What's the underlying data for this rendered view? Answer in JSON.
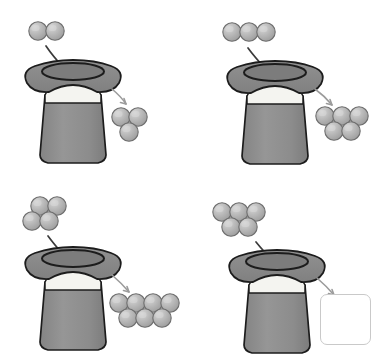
{
  "page": {
    "background_color": "#ffffff",
    "width": 388,
    "height": 356,
    "layout": "2x2 grid of hat panels"
  },
  "palette": {
    "ball_fill": "#b4b4b4",
    "ball_highlight": "#d2d2d2",
    "ball_shadow": "#9a9a9a",
    "ball_outline": "#6e6e6e",
    "hat_brim": "#8b8b8b",
    "hat_brim_outline": "#1c1c1c",
    "hat_body": "#8e8e8e",
    "hat_body_outline": "#1c1c1c",
    "hat_band": "#f4f4f0",
    "hat_opening": "#7a7a7a",
    "arrow_in": "#3a3a3a",
    "arrow_out": "#9b9b9b",
    "answer_box_border": "#c9c9c9",
    "answer_box_fill": "#ffffff"
  },
  "puzzle": {
    "kind": "function-machine",
    "machine_icon": "magic-hat",
    "rule_description": "output = 2 x input - 1",
    "unknown_marker": "empty answer box"
  },
  "panels": [
    {
      "id": "panel-1",
      "position": "top-left",
      "input": {
        "label": "2",
        "count": 2,
        "rows": [
          2
        ],
        "icon": "ball"
      },
      "machine": {
        "label": "magic hat",
        "icon": "magic-hat"
      },
      "arrow_in": {
        "icon": "curved-arrow-into-hat",
        "color": "#3a3a3a"
      },
      "arrow_out": {
        "icon": "curved-arrow-out-of-hat",
        "color": "#9b9b9b"
      },
      "output": {
        "label": "3",
        "count": 3,
        "rows": [
          2,
          1
        ],
        "icon": "ball",
        "is_unknown": false
      }
    },
    {
      "id": "panel-2",
      "position": "top-right",
      "input": {
        "label": "3",
        "count": 3,
        "rows": [
          3
        ],
        "icon": "ball"
      },
      "machine": {
        "label": "magic hat",
        "icon": "magic-hat"
      },
      "arrow_in": {
        "icon": "curved-arrow-into-hat",
        "color": "#3a3a3a"
      },
      "arrow_out": {
        "icon": "curved-arrow-out-of-hat",
        "color": "#9b9b9b"
      },
      "output": {
        "label": "5",
        "count": 5,
        "rows": [
          3,
          2
        ],
        "icon": "ball",
        "is_unknown": false
      }
    },
    {
      "id": "panel-3",
      "position": "bottom-left",
      "input": {
        "label": "4",
        "count": 4,
        "rows": [
          2,
          2
        ],
        "icon": "ball"
      },
      "machine": {
        "label": "magic hat",
        "icon": "magic-hat"
      },
      "arrow_in": {
        "icon": "curved-arrow-into-hat",
        "color": "#3a3a3a"
      },
      "arrow_out": {
        "icon": "curved-arrow-out-of-hat",
        "color": "#9b9b9b"
      },
      "output": {
        "label": "7",
        "count": 7,
        "rows": [
          4,
          3
        ],
        "icon": "ball",
        "is_unknown": false
      }
    },
    {
      "id": "panel-4",
      "position": "bottom-right",
      "input": {
        "label": "5",
        "count": 5,
        "rows": [
          3,
          2
        ],
        "icon": "ball"
      },
      "machine": {
        "label": "magic hat",
        "icon": "magic-hat"
      },
      "arrow_in": {
        "icon": "curved-arrow-into-hat",
        "color": "#3a3a3a"
      },
      "arrow_out": {
        "icon": "curved-arrow-out-of-hat",
        "color": "#9b9b9b"
      },
      "output": {
        "label": "",
        "count": 0,
        "rows": [],
        "icon": "empty-answer-box",
        "is_unknown": true
      }
    }
  ]
}
